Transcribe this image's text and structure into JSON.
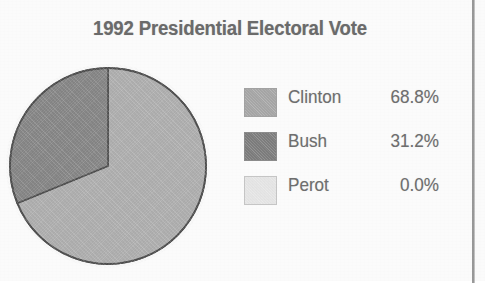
{
  "chart_data": {
    "type": "pie",
    "title": "1992 Presidential Electoral Vote",
    "xlabel": "",
    "ylabel": "",
    "legend_position": "right",
    "grid": false,
    "start_angle_deg": 0,
    "direction": "clockwise",
    "categories": [
      "Clinton",
      "Bush",
      "Perot"
    ],
    "values": [
      68.8,
      31.2,
      0.0
    ],
    "value_labels": [
      "68.8%",
      "31.2%",
      "0.0%"
    ],
    "colors": [
      "#b0b0b0",
      "#878787",
      "#e8e8e8"
    ],
    "slices": [
      {
        "label": "Clinton",
        "value": 68.8,
        "value_label": "68.8%",
        "color": "#b0b0b0",
        "swatch_color": "#a8a8a8",
        "start_deg": 0.0,
        "end_deg": 247.68
      },
      {
        "label": "Bush",
        "value": 31.2,
        "value_label": "31.2%",
        "color": "#878787",
        "swatch_color": "#7e7e7e",
        "start_deg": 247.68,
        "end_deg": 360.0
      },
      {
        "label": "Perot",
        "value": 0.0,
        "value_label": "0.0%",
        "color": "#e8e8e8",
        "swatch_color": "#e8e8e8",
        "start_deg": 360.0,
        "end_deg": 360.0
      }
    ]
  },
  "title": {
    "text": "1992 Presidential Electoral Vote",
    "color": "#6c6c6c"
  },
  "legend": {
    "rows": [
      {
        "label": "Clinton",
        "value": "68.8%",
        "swatch_color": "#a8a8a8"
      },
      {
        "label": "Bush",
        "value": "31.2%",
        "swatch_color": "#7e7e7e"
      },
      {
        "label": "Perot",
        "value": "0.0%",
        "swatch_color": "#e8e8e8"
      }
    ]
  },
  "pie": {
    "outline_color": "#4e4e4e",
    "center_x": 102,
    "center_y": 102,
    "radius": 98
  }
}
